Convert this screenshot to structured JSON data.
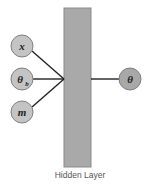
{
  "diagram": {
    "type": "neural-network",
    "hidden_layer": {
      "label": "Hidden Layer",
      "fill": "#a9a9a9",
      "stroke": "#8a8a8a"
    },
    "inputs": [
      {
        "id": "x",
        "label": "x",
        "subscript": ""
      },
      {
        "id": "theta_b",
        "label": "θ",
        "subscript": "b"
      },
      {
        "id": "m",
        "label": "m",
        "subscript": ""
      }
    ],
    "output": {
      "id": "theta",
      "label": "θ"
    },
    "colors": {
      "input_node_fill": "#c4c4c4",
      "output_node_fill": "#a8a8a8",
      "node_stroke": "#808080",
      "edge": "#222222"
    }
  }
}
